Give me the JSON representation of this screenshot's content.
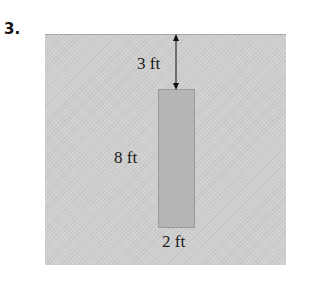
{
  "problem": {
    "number": "3."
  },
  "diagram": {
    "depth_label": "3 ft",
    "height_label": "8 ft",
    "width_label": "2 ft",
    "colors": {
      "water": "#cfcfcf",
      "plate": "#b5b5b5"
    }
  }
}
